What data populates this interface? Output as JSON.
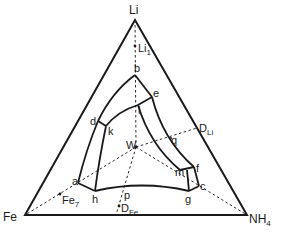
{
  "diagram": {
    "type": "ternary-phase-diagram",
    "vertices": {
      "top": {
        "label": "Li"
      },
      "left": {
        "label": "Fe"
      },
      "right": {
        "label": "NH",
        "subscript": "4"
      }
    },
    "points": {
      "li1": {
        "label": "Li",
        "subscript": "1"
      },
      "b": {
        "label": "b"
      },
      "e": {
        "label": "e"
      },
      "l": {
        "label": "l"
      },
      "d": {
        "label": "d"
      },
      "k": {
        "label": "k"
      },
      "w": {
        "label": "W"
      },
      "dli": {
        "label": "D",
        "subscript": "Li"
      },
      "q": {
        "label": "q"
      },
      "m": {
        "label": "m"
      },
      "f": {
        "label": "f"
      },
      "c": {
        "label": "c"
      },
      "g": {
        "label": "g"
      },
      "a": {
        "label": "a"
      },
      "h": {
        "label": "h"
      },
      "p": {
        "label": "p"
      },
      "dfe": {
        "label": "D",
        "subscript": "Fe"
      },
      "fe7": {
        "label": "Fe",
        "subscript": "7"
      }
    },
    "colors": {
      "line": "#1a1a1a",
      "background": "#ffffff"
    }
  }
}
